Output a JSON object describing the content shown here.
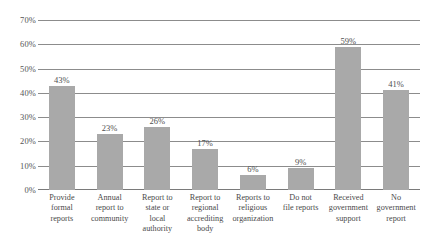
{
  "chart_data": {
    "type": "bar",
    "title": "",
    "subtitle": "",
    "xlabel": "",
    "ylabel": "",
    "ylim": [
      0,
      70
    ],
    "y_ticks": [
      "0%",
      "10%",
      "20%",
      "30%",
      "40%",
      "50%",
      "60%",
      "70%"
    ],
    "y_tick_values": [
      0,
      10,
      20,
      30,
      40,
      50,
      60,
      70
    ],
    "grid": true,
    "legend": "none",
    "bar_color": "#a9a9a9",
    "gridline_color": "#8c8c8c",
    "categories": [
      "Provide formal reports",
      "Annual report to community",
      "Report to state or local authority",
      "Report to regional accrediting body",
      "Reports to religious organization",
      "Do not file reports",
      "Received government support",
      "No government report"
    ],
    "category_lines": [
      [
        "Provide",
        "formal",
        "reports"
      ],
      [
        "Annual",
        "report to",
        "community"
      ],
      [
        "Report to",
        "state or",
        "local",
        "authority"
      ],
      [
        "Report to",
        "regional",
        "accrediting",
        "body"
      ],
      [
        "Reports to",
        "religious",
        "organization"
      ],
      [
        "Do not",
        "file reports"
      ],
      [
        "Received",
        "government",
        "support"
      ],
      [
        "No",
        "government",
        "report"
      ]
    ],
    "values": [
      43,
      23,
      26,
      17,
      6,
      9,
      59,
      41
    ],
    "value_labels": [
      "43%",
      "23%",
      "26%",
      "17%",
      "6%",
      "9%",
      "59%",
      "41%"
    ]
  }
}
